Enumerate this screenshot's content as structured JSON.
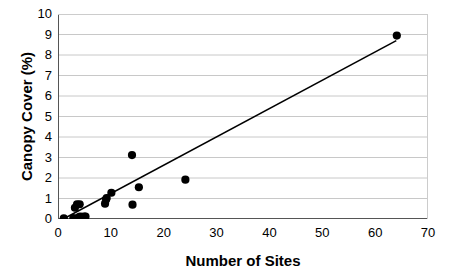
{
  "chart_data": {
    "type": "scatter",
    "title": "",
    "xlabel": "Number of Sites",
    "ylabel": "Canopy Cover (%)",
    "xlim": [
      0,
      70
    ],
    "ylim": [
      0,
      10
    ],
    "xticks": [
      0,
      10,
      20,
      30,
      40,
      50,
      60,
      70
    ],
    "yticks": [
      0,
      1,
      2,
      3,
      4,
      5,
      6,
      7,
      8,
      9,
      10
    ],
    "xtick_labels": [
      "0",
      "10",
      "20",
      "30",
      "40",
      "50",
      "60",
      "70"
    ],
    "ytick_labels": [
      "0",
      "1",
      "2",
      "3",
      "4",
      "5",
      "6",
      "7",
      "8",
      "9",
      "10"
    ],
    "grid": "horizontal",
    "grid_color": "#c8c8c8",
    "legend": "none",
    "marker_color": "#000000",
    "marker_shape": "circle",
    "marker_size": 5,
    "line_color": "#000000",
    "series": [
      {
        "name": "Canopy cover vs number of sites",
        "points": [
          {
            "x": 1.1,
            "y": 0.03
          },
          {
            "x": 2.9,
            "y": 0.05
          },
          {
            "x": 3.2,
            "y": 0.55
          },
          {
            "x": 3.6,
            "y": 0.72
          },
          {
            "x": 3.9,
            "y": 0.08
          },
          {
            "x": 4.1,
            "y": 0.72
          },
          {
            "x": 4.2,
            "y": 0.12
          },
          {
            "x": 4.6,
            "y": 0.1
          },
          {
            "x": 5.0,
            "y": 0.12
          },
          {
            "x": 5.2,
            "y": 0.12
          },
          {
            "x": 8.9,
            "y": 0.75
          },
          {
            "x": 9.1,
            "y": 0.95
          },
          {
            "x": 9.2,
            "y": 1.02
          },
          {
            "x": 10.1,
            "y": 1.28
          },
          {
            "x": 14.0,
            "y": 3.12
          },
          {
            "x": 14.1,
            "y": 0.7
          },
          {
            "x": 15.3,
            "y": 1.55
          },
          {
            "x": 24.1,
            "y": 1.92
          },
          {
            "x": 64.1,
            "y": 8.95
          }
        ]
      }
    ],
    "trendline": {
      "type": "linear",
      "x_start": 1.0,
      "y_start": 0.0,
      "x_end": 64.0,
      "y_end": 8.7
    }
  }
}
